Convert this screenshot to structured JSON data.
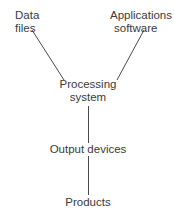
{
  "diagram": {
    "nodes": {
      "data_files": {
        "line1": "Data",
        "line2": "files"
      },
      "applications_software": {
        "line1": "Applications",
        "line2": "software"
      },
      "processing_system": {
        "line1": "Processing",
        "line2": "system"
      },
      "output_devices": {
        "label": "Output devices"
      },
      "products": {
        "label": "Products"
      }
    },
    "edges": [
      {
        "from": "Data files",
        "to": "Processing system"
      },
      {
        "from": "Applications software",
        "to": "Processing system"
      },
      {
        "from": "Processing system",
        "to": "Output devices"
      },
      {
        "from": "Output devices",
        "to": "Products"
      }
    ],
    "line_color": "#4a4a4a"
  }
}
